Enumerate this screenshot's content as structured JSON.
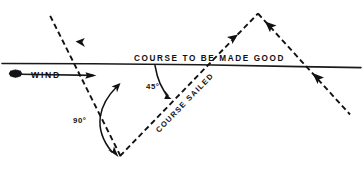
{
  "diagram": {
    "background_color": "#ffffff",
    "ink_color": "#111111",
    "labels": {
      "course_made_good": "COURSE TO BE MADE GOOD",
      "course_sailed": "COURSE SAILED",
      "wind": "WIND",
      "angle_45": "45°",
      "angle_90": "90°"
    },
    "lines": [
      {
        "name": "course-to-be-made-good",
        "style": "solid",
        "from": [
          2,
          63
        ],
        "to": [
          361,
          68
        ],
        "description": "horizontal base line representing the rhumb line"
      },
      {
        "name": "wind-arrow",
        "style": "solid-arrow",
        "from": [
          20,
          74
        ],
        "to": [
          96,
          76
        ],
        "description": "wind direction arrow pointing right"
      },
      {
        "name": "no-go-zone-upper-left",
        "style": "dashed-arrow",
        "from": [
          120,
          156
        ],
        "to": [
          46,
          12
        ],
        "description": "dashed limit of the no-go zone, arrow pointing up-left"
      },
      {
        "name": "course-sailed-leg-1",
        "style": "dashed-arrow",
        "from": [
          120,
          156
        ],
        "to": [
          258,
          13
        ],
        "description": "first tack, arrow pointing up-right toward tack point"
      },
      {
        "name": "course-sailed-leg-2",
        "style": "dashed-arrow",
        "from": [
          258,
          13
        ],
        "to": [
          350,
          114
        ],
        "description": "second tack, arrow pointing down-right after tacking"
      }
    ],
    "angles": [
      {
        "name": "angle-45",
        "value": "45°",
        "between": [
          "course-to-be-made-good",
          "course-sailed-leg-1"
        ],
        "vertex": [
          208,
          64
        ]
      },
      {
        "name": "angle-90",
        "value": "90°",
        "between": [
          "no-go-zone-upper-left",
          "course-sailed-leg-1"
        ],
        "vertex": [
          106,
          73
        ]
      }
    ],
    "markers": {
      "wind_source_blob": "scribbled ink blob at wind arrow tail",
      "tack_point": [
        258,
        13
      ]
    }
  }
}
